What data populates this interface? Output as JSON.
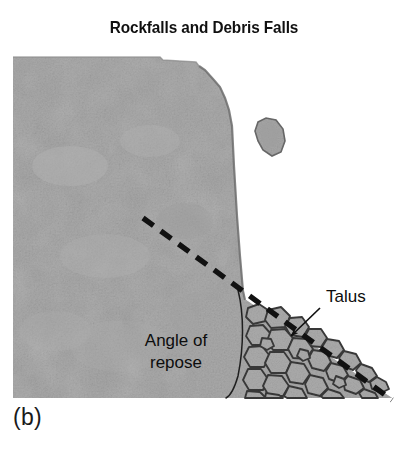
{
  "figure": {
    "title": "Rockfalls and Debris Falls",
    "panel_caption": "(b)",
    "labels": {
      "talus": "Talus",
      "angle_of_repose_line1": "Angle of",
      "angle_of_repose_line2": "repose"
    },
    "colors": {
      "background": "#ffffff",
      "cliff_rock": "#a8a8a8",
      "cliff_rock_shadow": "#9a9a9a",
      "sky_white": "#fbfbfb",
      "outline": "#2a2a2a",
      "clast_fill": "#ababab",
      "clast_outline": "#333333",
      "text": "#0d0d0d",
      "dashed_line": "#111111"
    },
    "diagram": {
      "type": "geology-cross-section",
      "elements": [
        "cliff-face",
        "falling-rock-fragment",
        "angle-of-repose-dashed-line",
        "angle-of-repose-arc",
        "talus-pile",
        "talus-leader-arrow"
      ],
      "cliff_top_y": 57,
      "cliff_left_x": 13,
      "cliff_base_y": 398,
      "talus_apex": [
        245,
        300
      ],
      "talus_toe": [
        392,
        398
      ],
      "dashed_line_start": [
        143,
        218
      ],
      "dashed_line_end": [
        392,
        400
      ],
      "arrow_tip": [
        288,
        338
      ]
    }
  }
}
